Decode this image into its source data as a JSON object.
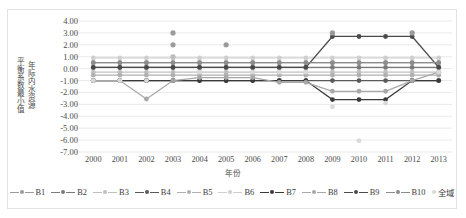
{
  "chart_data": {
    "type": "line",
    "title": "",
    "xlabel": "年份",
    "ylabel": "年际内水资源平衡系数最小值",
    "ylabel_lines": [
      "年际内水资源",
      "平衡系数最小值"
    ],
    "ylim": [
      -7,
      4
    ],
    "ystep": 1,
    "grid": true,
    "legend_position": "bottom",
    "categories": [
      "2000",
      "2001",
      "2002",
      "2003",
      "2004",
      "2005",
      "2006",
      "2007",
      "2008",
      "2009",
      "2010",
      "2011",
      "2012",
      "2013"
    ],
    "ytick_labels": [
      "4.00",
      "3.00",
      "2.00",
      "1.00",
      "0.00",
      "-1.00",
      "-2.00",
      "-3.00",
      "-4.00",
      "-5.00",
      "-6.00",
      "-7.00"
    ],
    "series": [
      {
        "name": "B1",
        "color": "#9b9b9b",
        "marker": "circle",
        "values": [
          0.5,
          0.5,
          0.5,
          0.5,
          0.5,
          0.5,
          0.5,
          0.5,
          0.5,
          0.5,
          0.5,
          0.5,
          0.5,
          0.5
        ]
      },
      {
        "name": "B2",
        "color": "#7a7a7a",
        "marker": "circle",
        "values": [
          0.1,
          0.1,
          0.1,
          0.1,
          0.1,
          0.1,
          0.1,
          0.1,
          0.1,
          0.1,
          0.1,
          0.1,
          0.1,
          0.1
        ]
      },
      {
        "name": "B3",
        "color": "#c0c0c0",
        "marker": "circle",
        "values": [
          -0.3,
          -0.3,
          -0.3,
          -0.3,
          -0.3,
          -0.3,
          -0.3,
          -0.3,
          -0.3,
          -0.3,
          -0.3,
          -0.3,
          -0.3,
          -0.3
        ]
      },
      {
        "name": "B4",
        "color": "#5a5a5a",
        "marker": "circle",
        "values": [
          -1.0,
          -1.0,
          -1.0,
          -1.0,
          -1.0,
          -1.0,
          -1.0,
          -1.0,
          -1.0,
          -1.0,
          -1.0,
          -1.0,
          -1.0,
          -1.0
        ]
      },
      {
        "name": "B5",
        "color": "#b0b0b0",
        "marker": "circle",
        "values": [
          -0.55,
          -0.55,
          -0.55,
          -0.55,
          -0.55,
          -0.55,
          -0.55,
          -0.55,
          -0.55,
          -0.55,
          -0.55,
          -0.55,
          -0.55,
          -0.55
        ]
      },
      {
        "name": "B6",
        "color": "#cfcfcf",
        "marker": "circle",
        "values": [
          0.9,
          0.9,
          0.9,
          0.9,
          0.9,
          0.9,
          0.9,
          0.9,
          0.9,
          0.9,
          0.9,
          0.9,
          0.9,
          0.9
        ]
      },
      {
        "name": "B7",
        "color": "#3a3a3a",
        "marker": "circle",
        "values": [
          -1.0,
          -1.0,
          -1.0,
          -1.0,
          -1.0,
          -1.0,
          -1.0,
          -1.0,
          -1.0,
          -2.6,
          -2.6,
          -2.6,
          -1.0,
          -1.0
        ]
      },
      {
        "name": "B8",
        "color": "#a8a8a8",
        "marker": "circle",
        "values": [
          -1.0,
          -1.0,
          -2.55,
          -1.0,
          -0.75,
          -0.75,
          -0.75,
          -1.15,
          -1.15,
          -1.9,
          -1.9,
          -1.9,
          -1.0,
          -0.3
        ]
      },
      {
        "name": "B9",
        "color": "#4a4a4a",
        "marker": "circle",
        "values": [
          0.1,
          0.1,
          0.1,
          0.1,
          0.1,
          0.1,
          0.1,
          0.1,
          0.1,
          2.7,
          2.7,
          2.7,
          2.7,
          0.1
        ]
      },
      {
        "name": "B10",
        "color": "#8c8c8c",
        "marker": "circle",
        "values": [
          0.5,
          0.5,
          0.5,
          0.5,
          0.5,
          0.5,
          0.5,
          0.5,
          0.5,
          0.5,
          0.5,
          0.5,
          0.5,
          0.5
        ]
      },
      {
        "name": "全域",
        "color": "#d9d9d9",
        "marker": "circle",
        "line": false,
        "values": [
          -1.0,
          -1.0,
          -1.0,
          1.0,
          -0.3,
          2.0,
          -0.3,
          -0.3,
          -0.3,
          -3.2,
          -6.05,
          -2.9,
          3.0,
          -0.3
        ]
      }
    ],
    "extra_points": [
      {
        "x": "2003",
        "y": 3.0,
        "color": "#9b9b9b"
      },
      {
        "x": "2003",
        "y": 2.0,
        "color": "#9b9b9b"
      },
      {
        "x": "2003",
        "y": 1.0,
        "color": "#bdbdbd"
      },
      {
        "x": "2005",
        "y": 2.0,
        "color": "#9b9b9b"
      },
      {
        "x": "2009",
        "y": 3.0,
        "color": "#9b9b9b"
      },
      {
        "x": "2012",
        "y": 3.0,
        "color": "#9b9b9b"
      }
    ]
  },
  "legend": {
    "items": [
      {
        "label": "B1"
      },
      {
        "label": "B2"
      },
      {
        "label": "B3"
      },
      {
        "label": "B4"
      },
      {
        "label": "B5"
      },
      {
        "label": "B6"
      },
      {
        "label": "B7"
      },
      {
        "label": "B8"
      },
      {
        "label": "B9"
      },
      {
        "label": "B10"
      },
      {
        "label": "全域"
      }
    ]
  }
}
